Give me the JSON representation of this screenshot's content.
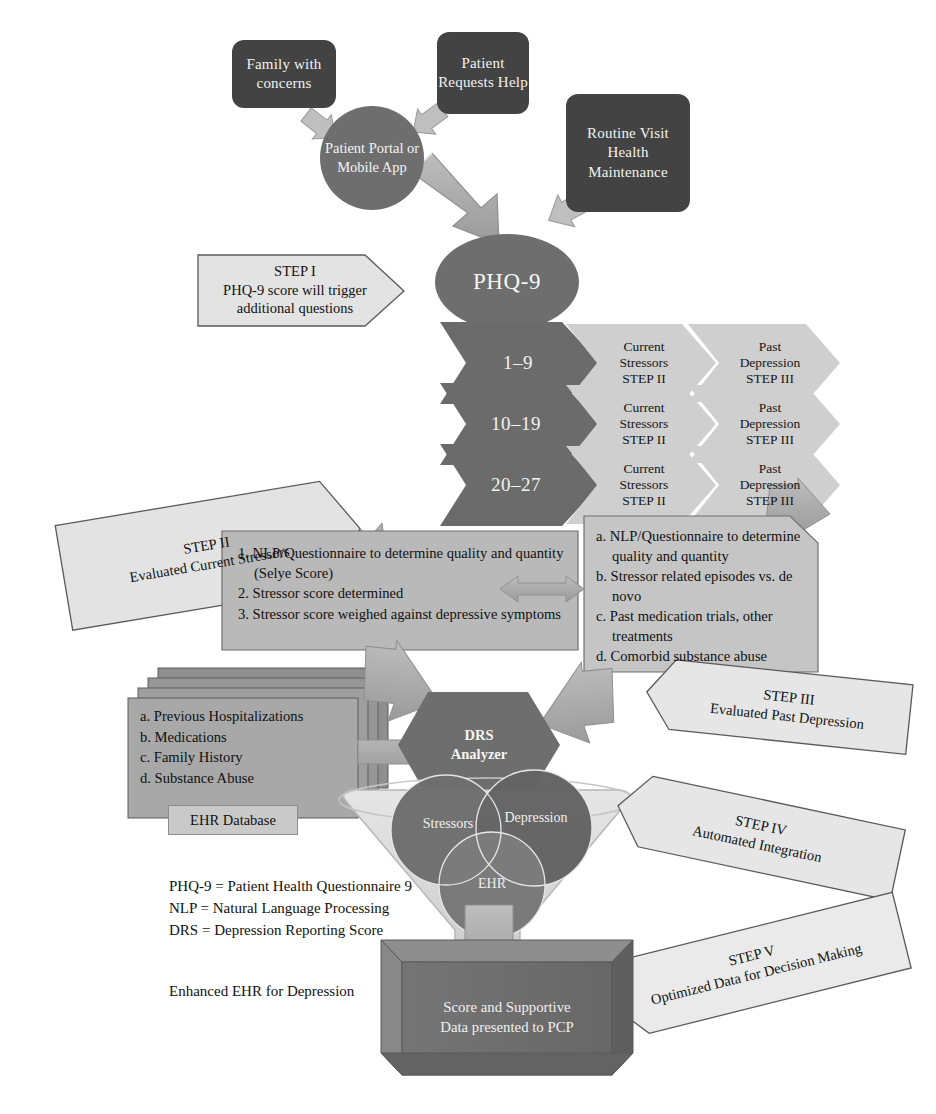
{
  "colors": {
    "dark_box": "#434343",
    "mid_gray": "#6e6e6e",
    "chevron_dark": "#6b6b6b",
    "chevron_light": "#cfcfcf",
    "panel_gray": "#b8b8b8",
    "panel_light": "#c4c4c4",
    "callout_fill": "#e2e2e2",
    "arrow_fill": "#a9a9a9",
    "funnel_fill": "#d9d9d9",
    "venn_fill": "#6e6e6e",
    "final_box": "#6e6e6e",
    "text_light": "#f2f2f2",
    "text_dark": "#111111"
  },
  "sources": [
    {
      "id": "family",
      "label": "Family with concerns"
    },
    {
      "id": "patient_request",
      "label": "Patient Requests Help"
    },
    {
      "id": "routine_visit",
      "label": "Routine Visit Health Maintenance"
    }
  ],
  "entry_node": {
    "label": "Patient Portal or Mobile App"
  },
  "screening": {
    "label": "PHQ-9"
  },
  "step_callouts": {
    "step1": {
      "step": "STEP I",
      "desc": "PHQ-9 score will trigger additional questions"
    },
    "step2": {
      "step": "STEP II",
      "desc": "Evaluated Current Stressors"
    },
    "step3": {
      "step": "STEP III",
      "desc": "Evaluated Past Depression"
    },
    "step4": {
      "step": "STEP IV",
      "desc": "Automated Integration"
    },
    "step5": {
      "step": "STEP V",
      "desc": "Optimized Data for Decision Making"
    }
  },
  "score_rows": [
    {
      "score": "1–9",
      "branch_a": "Current Stressors STEP II",
      "branch_b": "Past Depression STEP III"
    },
    {
      "score": "10–19",
      "branch_a": "Current Stressors STEP II",
      "branch_b": "Past Depression STEP III"
    },
    {
      "score": "20–27",
      "branch_a": "Current Stressors STEP II",
      "branch_b": "Past Depression STEP III"
    }
  ],
  "score_branch_lines": {
    "a_line1": "Current",
    "a_line2": "Stressors",
    "a_line3": "STEP II",
    "b_line1": "Past",
    "b_line2": "Depression",
    "b_line3": "STEP III"
  },
  "stressor_panel": {
    "items": [
      "1. NLP/Questionnaire to determine quality and quantity (Selye Score)",
      "2. Stressor score determined",
      "3. Stressor score weighed against depressive symptoms"
    ]
  },
  "depression_panel": {
    "items": [
      "a. NLP/Questionnaire to determine quality and quantity",
      "b. Stressor related episodes vs. de novo",
      "c. Past medication trials, other treatments",
      "d. Comorbid substance abuse"
    ]
  },
  "ehr_stack": {
    "items": [
      "a. Previous Hospitalizations",
      "b. Medications",
      "c. Family History",
      "d. Substance Abuse"
    ],
    "db_label": "EHR Database"
  },
  "analyzer": {
    "line1": "DRS",
    "line2": "Analyzer"
  },
  "venn": {
    "stressors": "Stressors",
    "depression": "Depression",
    "ehr": "EHR"
  },
  "final_output": {
    "line1": "Score and Supportive",
    "line2": "Data presented to PCP"
  },
  "legend": [
    "PHQ-9 = Patient Health Questionnaire 9",
    "NLP = Natural Language Processing",
    "DRS = Depression Reporting Score"
  ],
  "caption": "Enhanced EHR for Depression"
}
